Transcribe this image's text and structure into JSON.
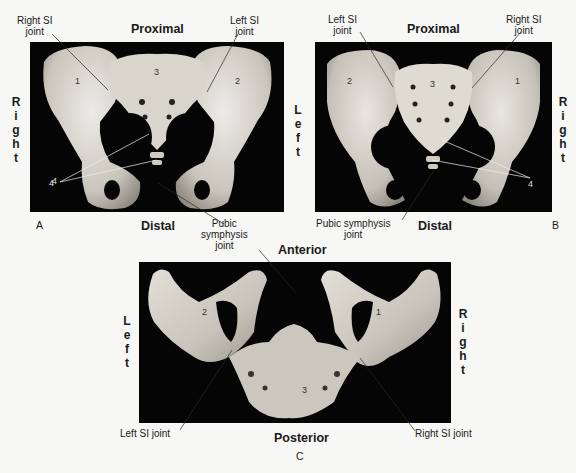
{
  "figure": {
    "panel_a": {
      "letter": "A",
      "top_label": "Proximal",
      "bottom_label": "Distal",
      "side_label": "Right",
      "callouts": {
        "right_si_joint": "Right SI joint",
        "left_si_joint": "Left SI joint",
        "pubic_symphysis_joint": "Pubic symphysis joint",
        "number_4": "4"
      },
      "bone_numbers": [
        "1",
        "2",
        "3"
      ]
    },
    "panel_b": {
      "letter": "B",
      "top_label": "Proximal",
      "bottom_label": "Distal",
      "side_label": "Left",
      "side_label_right": "Right",
      "callouts": {
        "left_si_joint": "Left SI joint",
        "right_si_joint": "Right SI joint",
        "pubic_symphysis_joint": "Pubic symphysis joint",
        "number_4": "4"
      },
      "bone_numbers": [
        "2",
        "3",
        "1"
      ]
    },
    "panel_c": {
      "letter": "C",
      "top_label": "Anterior",
      "bottom_label": "Posterior",
      "side_label": "Left",
      "side_label_right": "Right",
      "callouts": {
        "left_si_joint": "Left SI joint",
        "right_si_joint": "Right SI joint"
      },
      "bone_numbers": [
        "2",
        "1",
        "3"
      ]
    },
    "shared_labels": {
      "right_si_1": "Right SI",
      "joint": "joint",
      "left_si_1": "Left SI",
      "pubic": "Pubic",
      "symphysis": "symphysis",
      "pubic_symphysis": "Pubic symphysis"
    },
    "colors": {
      "background": "#f7f7f5",
      "panel": "#050505",
      "bone_light": "#e6e3dc",
      "bone_mid": "#bdb9b0",
      "bone_dark": "#8e8a82"
    }
  }
}
